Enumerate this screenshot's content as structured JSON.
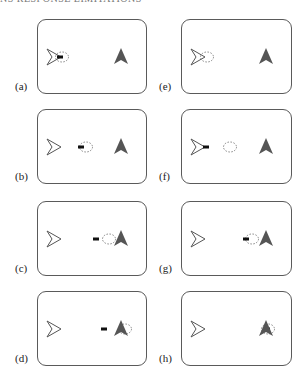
{
  "header": {
    "text": "NS RESPONSE LIMITATIONS"
  },
  "colors": {
    "border": "#5a5a5a",
    "open_arrow_stroke": "#555555",
    "filled_arrow": "#555555",
    "bar": "#111111",
    "dashed_circle": "#777777"
  },
  "panels": [
    {
      "id": "a",
      "label": "(a)",
      "col": 0,
      "row": 0,
      "bar_x": 19,
      "circle_x": 18,
      "bar_visible": true
    },
    {
      "id": "b",
      "label": "(b)",
      "col": 0,
      "row": 1,
      "bar_x": 40,
      "circle_x": 42,
      "bar_visible": true
    },
    {
      "id": "c",
      "label": "(c)",
      "col": 0,
      "row": 2,
      "bar_x": 55,
      "circle_x": 65,
      "bar_visible": true
    },
    {
      "id": "d",
      "label": "(d)",
      "col": 0,
      "row": 3,
      "bar_x": 63,
      "circle_x": 81,
      "bar_visible": true
    },
    {
      "id": "e",
      "label": "(e)",
      "col": 1,
      "row": 0,
      "bar_x": 0,
      "circle_x": 19,
      "bar_visible": false
    },
    {
      "id": "f",
      "label": "(f)",
      "col": 1,
      "row": 1,
      "bar_x": 21,
      "circle_x": 42,
      "bar_visible": true
    },
    {
      "id": "g",
      "label": "(g)",
      "col": 1,
      "row": 2,
      "bar_x": 61,
      "circle_x": 64,
      "bar_visible": true
    },
    {
      "id": "h",
      "label": "(h)",
      "col": 1,
      "row": 3,
      "bar_x": 82,
      "circle_x": 80,
      "bar_visible": true
    }
  ]
}
